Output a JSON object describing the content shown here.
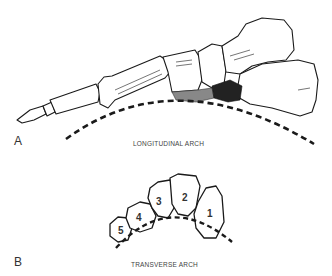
{
  "panels": [
    {
      "label": "A",
      "caption": "LONGITUDINAL ARCH",
      "subject": "medial view of foot skeleton with dashed arch curve"
    },
    {
      "label": "B",
      "caption": "TRANSVERSE ARCH",
      "subject": "cross-section of metatarsals with dashed arch curve"
    }
  ],
  "transverse_bones": [
    "1",
    "2",
    "3",
    "4",
    "5"
  ],
  "colors": {
    "line": "#1a1a1a",
    "shade_dark": "#222222",
    "shade_mid": "#777777",
    "fill": "#ffffff",
    "text": "#333333"
  }
}
